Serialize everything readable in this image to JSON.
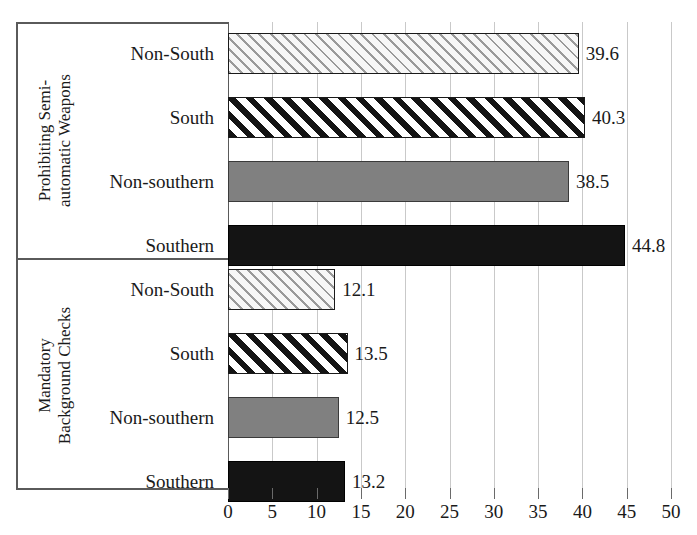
{
  "chart_data": {
    "type": "bar",
    "orientation": "horizontal",
    "title": "",
    "xlabel": "",
    "ylabel": "",
    "xlim": [
      0,
      50
    ],
    "xticks": [
      0,
      5,
      10,
      15,
      20,
      25,
      30,
      35,
      40,
      45,
      50
    ],
    "grid": true,
    "legend": "none",
    "groups": [
      {
        "label_line1": "Prohibiting Semi-",
        "label_line2": "automatic Weapons",
        "categories": [
          "Non-South",
          "South",
          "Non-southern",
          "Southern"
        ],
        "values": [
          39.6,
          40.3,
          38.5,
          44.8
        ],
        "value_labels": [
          "39.6",
          "40.3",
          "38.5",
          "44.8"
        ],
        "fills": [
          "thin-hatch",
          "bold-hatch",
          "solid-gray",
          "solid-black"
        ]
      },
      {
        "label_line1": "Mandatory",
        "label_line2": "Background Checks",
        "categories": [
          "Non-South",
          "South",
          "Non-southern",
          "Southern"
        ],
        "values": [
          12.1,
          13.5,
          12.5,
          13.2
        ],
        "value_labels": [
          "12.1",
          "13.5",
          "12.5",
          "13.2"
        ],
        "fills": [
          "thin-hatch",
          "bold-hatch",
          "solid-gray",
          "solid-black"
        ]
      }
    ],
    "colors": {
      "solid_gray": "#808080",
      "solid_black": "#141414",
      "hatch_light": "#9a9a9a",
      "hatch_dark": "#141414",
      "gridline": "#c9c9c9",
      "axis": "#5a5a5a",
      "background": "#ffffff"
    }
  }
}
